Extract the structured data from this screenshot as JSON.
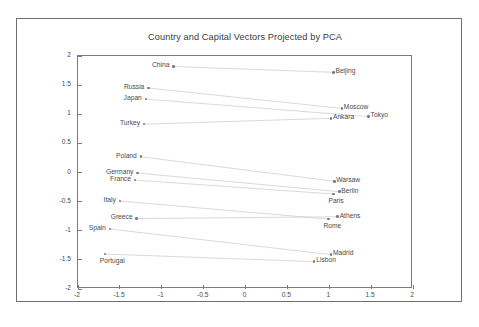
{
  "chart_data": {
    "type": "scatter",
    "title": "Country and Capital Vectors Projected by PCA",
    "xlabel": "",
    "ylabel": "",
    "xlim": [
      -2,
      2
    ],
    "ylim": [
      -2,
      2
    ],
    "grid": false,
    "legend": "none",
    "xticks": [
      "-2",
      "-1.5",
      "-1",
      "-0.5",
      "0",
      "0.5",
      "1",
      "1.5",
      "2"
    ],
    "xtick_values": [
      -2,
      -1.5,
      -1,
      -0.5,
      0,
      0.5,
      1,
      1.5,
      2
    ],
    "yticks": [
      "2",
      "1.5",
      "1",
      "0.5",
      "0",
      "-0.5",
      "-1",
      "-1.5",
      "-2"
    ],
    "ytick_values": [
      2,
      1.5,
      1,
      0.5,
      0,
      -0.5,
      -1,
      -1.5,
      -2
    ],
    "points": [
      {
        "label": "China",
        "x": -0.86,
        "y": 1.82,
        "label_side": "left",
        "kind": "country"
      },
      {
        "label": "Beijing",
        "x": 1.05,
        "y": 1.72,
        "label_side": "right",
        "kind": "capital"
      },
      {
        "label": "Russia",
        "x": -1.16,
        "y": 1.45,
        "label_side": "left",
        "kind": "country"
      },
      {
        "label": "Japan",
        "x": -1.19,
        "y": 1.26,
        "label_side": "left",
        "kind": "country"
      },
      {
        "label": "Moscow",
        "x": 1.15,
        "y": 1.1,
        "label_side": "right",
        "kind": "capital"
      },
      {
        "label": "Tokyo",
        "x": 1.47,
        "y": 0.96,
        "label_side": "right",
        "kind": "capital"
      },
      {
        "label": "Ankara",
        "x": 1.02,
        "y": 0.93,
        "label_side": "right",
        "kind": "capital"
      },
      {
        "label": "Turkey",
        "x": -1.21,
        "y": 0.83,
        "label_side": "left",
        "kind": "country"
      },
      {
        "label": "Poland",
        "x": -1.25,
        "y": 0.27,
        "label_side": "left",
        "kind": "country"
      },
      {
        "label": "Germany",
        "x": -1.29,
        "y": -0.01,
        "label_side": "left",
        "kind": "country"
      },
      {
        "label": "France",
        "x": -1.32,
        "y": -0.13,
        "label_side": "left",
        "kind": "country"
      },
      {
        "label": "Warsaw",
        "x": 1.06,
        "y": -0.15,
        "label_side": "right",
        "kind": "capital"
      },
      {
        "label": "Berlin",
        "x": 1.12,
        "y": -0.33,
        "label_side": "right",
        "kind": "capital"
      },
      {
        "label": "Paris",
        "x": 1.05,
        "y": -0.37,
        "label_side": "below",
        "kind": "capital"
      },
      {
        "label": "Italy",
        "x": -1.5,
        "y": -0.49,
        "label_side": "left",
        "kind": "country"
      },
      {
        "label": "Athens",
        "x": 1.1,
        "y": -0.76,
        "label_side": "right",
        "kind": "capital"
      },
      {
        "label": "Greece",
        "x": -1.3,
        "y": -0.79,
        "label_side": "left",
        "kind": "country"
      },
      {
        "label": "Rome",
        "x": 0.99,
        "y": -0.8,
        "label_side": "below",
        "kind": "capital"
      },
      {
        "label": "Spain",
        "x": -1.62,
        "y": -0.97,
        "label_side": "left",
        "kind": "country"
      },
      {
        "label": "Madrid",
        "x": 1.02,
        "y": -1.41,
        "label_side": "right",
        "kind": "capital"
      },
      {
        "label": "Portugal",
        "x": -1.68,
        "y": -1.4,
        "label_side": "below",
        "kind": "country"
      },
      {
        "label": "Lisbon",
        "x": 0.82,
        "y": -1.53,
        "label_side": "right",
        "kind": "capital"
      }
    ],
    "links": [
      {
        "from": "China",
        "to": "Beijing"
      },
      {
        "from": "Russia",
        "to": "Moscow"
      },
      {
        "from": "Japan",
        "to": "Tokyo"
      },
      {
        "from": "Turkey",
        "to": "Ankara"
      },
      {
        "from": "Poland",
        "to": "Warsaw"
      },
      {
        "from": "Germany",
        "to": "Berlin"
      },
      {
        "from": "France",
        "to": "Paris"
      },
      {
        "from": "Italy",
        "to": "Rome"
      },
      {
        "from": "Greece",
        "to": "Athens"
      },
      {
        "from": "Spain",
        "to": "Madrid"
      },
      {
        "from": "Portugal",
        "to": "Lisbon"
      }
    ],
    "colors": {
      "marker": "#7a7a7a",
      "link": "#c9c9c9",
      "axis": "#7c7c7c",
      "text": "#4a4a4a",
      "frame": "#6e6e6e",
      "background": "#ffffff"
    }
  }
}
